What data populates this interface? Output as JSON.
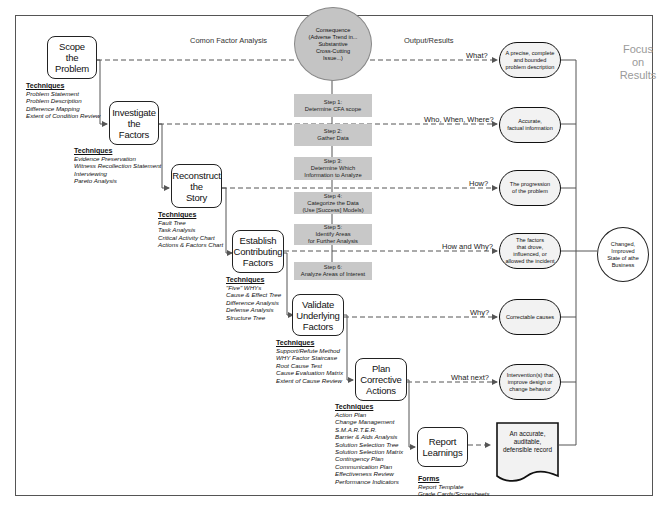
{
  "headers": {
    "analysis": "Comon Factor Analysis",
    "output": "Output/Results",
    "focus": "Focus\non\nResults"
  },
  "consequence": "Consequence\n(Adverse Trend in...\nSubstantive\nCross-Cutting\nIssue...)",
  "steps": [
    "Step 1:\nDetermine CFA scope",
    "Step 2:\nGather Data",
    "Step 3:\nDetermine Which\nInformation to Analyze",
    "Step 4:\nCategorize the Data\n(Use [Success] Models)",
    "Step 5:\nIdentify Areas\nfor Further Analysis",
    "Step 6:\nAnalyze Areas of Interest"
  ],
  "phases": [
    {
      "label": "Scope\nthe\nProblem",
      "techniques_heading": "Techniques",
      "techniques": [
        "Problem Statement",
        "Problem Description",
        "Difference Mapping",
        "Extent of Condition Review"
      ],
      "question": "What?",
      "output": "A precise, complete\nand bounded\nproblem description"
    },
    {
      "label": "Investigate\nthe\nFactors",
      "techniques_heading": "Techniques",
      "techniques": [
        "Evidence Preservation",
        "Witness Recollection Statement",
        "Interviewing",
        "Pareto Analysis"
      ],
      "question": "Who, When, Where?",
      "output": "Accurate,\nfactual information"
    },
    {
      "label": "Reconstruct\nthe\nStory",
      "techniques_heading": "Techniques",
      "techniques": [
        "Fault Tree",
        "Task Analysis",
        "Critical Activity Chart",
        "Actions & Factors Chart"
      ],
      "question": "How?",
      "output": "The progression\nof the problem"
    },
    {
      "label": "Establish\nContributing\nFactors",
      "techniques_heading": "Techniques",
      "techniques": [
        "\"Five\" WHYs",
        "Cause & Effect Tree",
        "Difference Analysis",
        "Defense Analysis",
        "Structure Tree"
      ],
      "question": "How and Why?",
      "output": "The factors\nthat drove,\ninfluenced, or\nallowed the incident"
    },
    {
      "label": "Validate\nUnderlying\nFactors",
      "techniques_heading": "Techniques",
      "techniques": [
        "Support/Refute Method",
        "WHY Factor Staircase",
        "Root Cause Test",
        "Cause Evaluation Matrix",
        "Extent of Cause Review"
      ],
      "question": "Why?",
      "output": "Correctable causes"
    },
    {
      "label": "Plan\nCorrective\nActions",
      "techniques_heading": "Techniques",
      "techniques": [
        "Action Plan",
        "Change Management",
        "S.M.A.R.T.E.R.",
        "Barrier & Aids Analysis",
        "Solution Selection Tree",
        "Solution Selection Matrix",
        "Contingency Plan",
        "Communication Plan",
        "Effectiveness Review",
        "Performance Indicators"
      ],
      "question": "What next?",
      "output": "Intervention(s) that\nimprove design or\nchange behavior"
    },
    {
      "label": "Report\nLearnings",
      "techniques_heading": "Forms",
      "techniques": [
        "Report Template",
        "Grade Cards/Scoresheets"
      ],
      "question": "",
      "output": "An accurate,\nauditable,\ndefensible record"
    }
  ],
  "final_result": "Changed,\nImproved\nState of athe\nBusiness",
  "colors": {
    "step_fill": "#c8c8c8",
    "consequence_fill": "#c4c4c4",
    "pill_fill": "#f2f2f2",
    "focus_text": "#9a9a9a",
    "line": "#333333"
  }
}
